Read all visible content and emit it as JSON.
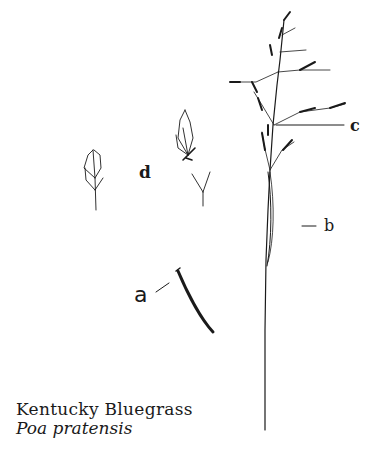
{
  "figure": {
    "title": "Kentucky Bluegrass",
    "scientific_name": "Poa pratensis",
    "parts": [
      {
        "key": "a",
        "label": "a",
        "depicts": "leaf blade segment"
      },
      {
        "key": "b",
        "label": "b",
        "depicts": "sheath on culm"
      },
      {
        "key": "c",
        "label": "c",
        "depicts": "panicle branch node"
      },
      {
        "key": "d",
        "label": "d",
        "depicts": "spikelets and florets"
      }
    ],
    "ink_color": "#1a1a1a",
    "background": "#ffffff"
  }
}
